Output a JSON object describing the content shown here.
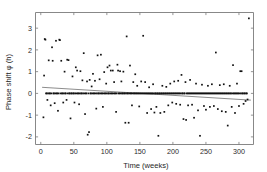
{
  "chart_data": {
    "type": "scatter",
    "title": "",
    "xlabel": "Time (weeks)",
    "ylabel": "Phase shift φ (h)",
    "xlim": [
      -8,
      322
    ],
    "ylim": [
      -2.35,
      3.72
    ],
    "xticks": [
      0,
      50,
      100,
      150,
      200,
      250,
      300
    ],
    "xticklabels": [
      "0",
      "50",
      "100",
      "150",
      "200",
      "250",
      "300"
    ],
    "yticks": [
      -2,
      -1,
      0,
      1,
      2,
      3
    ],
    "yticklabels": [
      "-2",
      "-1",
      "0",
      "1",
      "2",
      "3"
    ],
    "grid": false,
    "legend": null,
    "marker": "square",
    "marker_color": "#111111",
    "axis_color": "#7a7a7a",
    "trend_line": {
      "name": "linear fit",
      "color": "#6e6e6e",
      "x": [
        2,
        318
      ],
      "y": [
        0.28,
        -0.31
      ],
      "intercept": 0.284,
      "slope": -0.00187
    },
    "series": [
      {
        "name": "Phase shift observations",
        "points": [
          [
            4,
            -1.1
          ],
          [
            5,
            0.82
          ],
          [
            6,
            2.5
          ],
          [
            7,
            2.47
          ],
          [
            8,
            0.0
          ],
          [
            9,
            0.0
          ],
          [
            10,
            -0.3
          ],
          [
            11,
            0.0
          ],
          [
            12,
            1.52
          ],
          [
            13,
            0.0
          ],
          [
            14,
            0.0
          ],
          [
            15,
            -0.55
          ],
          [
            16,
            0.0
          ],
          [
            17,
            2.12
          ],
          [
            18,
            1.5
          ],
          [
            19,
            0.0
          ],
          [
            20,
            0.0
          ],
          [
            21,
            -0.45
          ],
          [
            22,
            0.0
          ],
          [
            23,
            2.42
          ],
          [
            24,
            0.0
          ],
          [
            25,
            0.0
          ],
          [
            26,
            -0.8
          ],
          [
            27,
            0.0
          ],
          [
            28,
            2.47
          ],
          [
            29,
            2.45
          ],
          [
            30,
            0.0
          ],
          [
            31,
            1.5
          ],
          [
            32,
            0.0
          ],
          [
            33,
            0.0
          ],
          [
            34,
            -0.42
          ],
          [
            35,
            0.0
          ],
          [
            36,
            1.0
          ],
          [
            37,
            0.0
          ],
          [
            38,
            0.0
          ],
          [
            39,
            -0.3
          ],
          [
            40,
            1.55
          ],
          [
            41,
            0.0
          ],
          [
            42,
            1.53
          ],
          [
            43,
            0.0
          ],
          [
            44,
            0.0
          ],
          [
            45,
            -1.15
          ],
          [
            46,
            0.0
          ],
          [
            47,
            0.0
          ],
          [
            48,
            0.78
          ],
          [
            49,
            0.0
          ],
          [
            50,
            0.0
          ],
          [
            51,
            -0.42
          ],
          [
            52,
            0.0
          ],
          [
            53,
            1.2
          ],
          [
            54,
            0.0
          ],
          [
            55,
            1.05
          ],
          [
            56,
            0.0
          ],
          [
            57,
            0.0
          ],
          [
            58,
            -0.5
          ],
          [
            59,
            0.0
          ],
          [
            60,
            1.02
          ],
          [
            61,
            0.0
          ],
          [
            62,
            0.0
          ],
          [
            63,
            0.6
          ],
          [
            64,
            0.0
          ],
          [
            65,
            1.85
          ],
          [
            66,
            0.0
          ],
          [
            67,
            -0.95
          ],
          [
            68,
            0.0
          ],
          [
            69,
            0.0
          ],
          [
            70,
            0.55
          ],
          [
            71,
            -1.9
          ],
          [
            72,
            0.0
          ],
          [
            73,
            -1.78
          ],
          [
            74,
            0.62
          ],
          [
            75,
            0.0
          ],
          [
            76,
            0.0
          ],
          [
            77,
            0.32
          ],
          [
            78,
            0.0
          ],
          [
            79,
            0.9
          ],
          [
            80,
            0.0
          ],
          [
            81,
            0.0
          ],
          [
            82,
            0.58
          ],
          [
            83,
            0.0
          ],
          [
            84,
            -0.7
          ],
          [
            85,
            0.0
          ],
          [
            86,
            1.75
          ],
          [
            87,
            0.0
          ],
          [
            88,
            0.0
          ],
          [
            89,
            0.65
          ],
          [
            90,
            0.0
          ],
          [
            91,
            1.78
          ],
          [
            92,
            0.0
          ],
          [
            93,
            0.0
          ],
          [
            94,
            -0.62
          ],
          [
            95,
            0.0
          ],
          [
            96,
            0.98
          ],
          [
            97,
            0.0
          ],
          [
            98,
            0.0
          ],
          [
            99,
            0.45
          ],
          [
            100,
            0.0
          ],
          [
            101,
            1.2
          ],
          [
            102,
            0.0
          ],
          [
            103,
            0.0
          ],
          [
            104,
            1.28
          ],
          [
            105,
            0.0
          ],
          [
            106,
            1.05
          ],
          [
            107,
            0.0
          ],
          [
            108,
            0.0
          ],
          [
            109,
            1.05
          ],
          [
            110,
            0.0
          ],
          [
            111,
            0.52
          ],
          [
            112,
            0.0
          ],
          [
            113,
            0.0
          ],
          [
            114,
            -0.85
          ],
          [
            115,
            0.0
          ],
          [
            116,
            1.32
          ],
          [
            117,
            1.05
          ],
          [
            118,
            0.0
          ],
          [
            119,
            0.0
          ],
          [
            120,
            1.02
          ],
          [
            121,
            0.0
          ],
          [
            122,
            0.55
          ],
          [
            123,
            0.0
          ],
          [
            124,
            0.0
          ],
          [
            125,
            1.0
          ],
          [
            126,
            0.0
          ],
          [
            127,
            0.0
          ],
          [
            128,
            -1.35
          ],
          [
            129,
            0.0
          ],
          [
            130,
            2.62
          ],
          [
            131,
            0.0
          ],
          [
            132,
            0.0
          ],
          [
            133,
            -1.35
          ],
          [
            134,
            0.0
          ],
          [
            135,
            1.28
          ],
          [
            136,
            0.0
          ],
          [
            137,
            0.0
          ],
          [
            138,
            -0.55
          ],
          [
            139,
            0.0
          ],
          [
            140,
            0.52
          ],
          [
            141,
            0.0
          ],
          [
            142,
            0.0
          ],
          [
            143,
            0.88
          ],
          [
            144,
            0.0
          ],
          [
            145,
            0.0
          ],
          [
            146,
            0.35
          ],
          [
            147,
            0.0
          ],
          [
            148,
            0.0
          ],
          [
            149,
            -0.6
          ],
          [
            150,
            0.0
          ],
          [
            151,
            0.0
          ],
          [
            152,
            0.55
          ],
          [
            153,
            0.0
          ],
          [
            154,
            0.0
          ],
          [
            155,
            2.65
          ],
          [
            156,
            0.0
          ],
          [
            157,
            0.0
          ],
          [
            158,
            0.52
          ],
          [
            159,
            0.0
          ],
          [
            160,
            0.0
          ],
          [
            161,
            -0.9
          ],
          [
            162,
            0.0
          ],
          [
            163,
            0.0
          ],
          [
            164,
            0.28
          ],
          [
            165,
            0.0
          ],
          [
            166,
            0.0
          ],
          [
            167,
            -0.72
          ],
          [
            168,
            0.0
          ],
          [
            169,
            0.0
          ],
          [
            170,
            0.42
          ],
          [
            171,
            0.0
          ],
          [
            172,
            -0.88
          ],
          [
            173,
            0.0
          ],
          [
            174,
            0.0
          ],
          [
            175,
            -0.62
          ],
          [
            176,
            0.0
          ],
          [
            177,
            0.0
          ],
          [
            178,
            -1.95
          ],
          [
            179,
            0.0
          ],
          [
            180,
            0.0
          ],
          [
            181,
            -0.9
          ],
          [
            182,
            0.0
          ],
          [
            183,
            0.0
          ],
          [
            184,
            0.35
          ],
          [
            185,
            0.0
          ],
          [
            186,
            0.0
          ],
          [
            187,
            -0.85
          ],
          [
            188,
            0.0
          ],
          [
            189,
            0.0
          ],
          [
            190,
            0.3
          ],
          [
            191,
            0.0
          ],
          [
            192,
            0.0
          ],
          [
            193,
            -0.55
          ],
          [
            194,
            0.0
          ],
          [
            195,
            0.0
          ],
          [
            196,
            0.45
          ],
          [
            197,
            0.0
          ],
          [
            198,
            0.0
          ],
          [
            199,
            -0.42
          ],
          [
            200,
            0.0
          ],
          [
            201,
            0.0
          ],
          [
            202,
            0.55
          ],
          [
            203,
            0.0
          ],
          [
            204,
            0.0
          ],
          [
            205,
            -0.48
          ],
          [
            206,
            0.0
          ],
          [
            207,
            0.0
          ],
          [
            208,
            0.58
          ],
          [
            209,
            0.0
          ],
          [
            210,
            0.0
          ],
          [
            211,
            -0.52
          ],
          [
            212,
            0.0
          ],
          [
            213,
            0.85
          ],
          [
            214,
            0.0
          ],
          [
            215,
            0.0
          ],
          [
            216,
            -1.18
          ],
          [
            217,
            0.0
          ],
          [
            218,
            0.0
          ],
          [
            219,
            0.52
          ],
          [
            220,
            -1.22
          ],
          [
            221,
            0.0
          ],
          [
            222,
            0.0
          ],
          [
            223,
            -0.55
          ],
          [
            224,
            0.0
          ],
          [
            225,
            0.0
          ],
          [
            226,
            0.62
          ],
          [
            227,
            0.0
          ],
          [
            228,
            0.0
          ],
          [
            229,
            -0.52
          ],
          [
            230,
            0.0
          ],
          [
            231,
            0.0
          ],
          [
            232,
            -1.12
          ],
          [
            233,
            0.0
          ],
          [
            234,
            0.0
          ],
          [
            235,
            0.45
          ],
          [
            236,
            0.0
          ],
          [
            237,
            0.0
          ],
          [
            238,
            -0.78
          ],
          [
            239,
            0.0
          ],
          [
            240,
            0.0
          ],
          [
            241,
            -1.95
          ],
          [
            242,
            0.0
          ],
          [
            243,
            0.0
          ],
          [
            244,
            0.4
          ],
          [
            245,
            0.0
          ],
          [
            246,
            0.0
          ],
          [
            247,
            -0.58
          ],
          [
            248,
            0.0
          ],
          [
            249,
            0.0
          ],
          [
            250,
            -0.75
          ],
          [
            251,
            0.0
          ],
          [
            252,
            0.0
          ],
          [
            253,
            0.35
          ],
          [
            254,
            0.0
          ],
          [
            255,
            0.0
          ],
          [
            256,
            -0.62
          ],
          [
            257,
            0.0
          ],
          [
            258,
            0.0
          ],
          [
            259,
            0.42
          ],
          [
            260,
            0.0
          ],
          [
            261,
            0.0
          ],
          [
            262,
            -0.58
          ],
          [
            263,
            0.0
          ],
          [
            264,
            0.0
          ],
          [
            265,
            1.88
          ],
          [
            266,
            0.0
          ],
          [
            267,
            0.0
          ],
          [
            268,
            -0.72
          ],
          [
            269,
            0.0
          ],
          [
            270,
            0.0
          ],
          [
            271,
            0.38
          ],
          [
            272,
            0.0
          ],
          [
            273,
            0.0
          ],
          [
            274,
            -0.82
          ],
          [
            275,
            0.0
          ],
          [
            276,
            0.0
          ],
          [
            277,
            0.42
          ],
          [
            278,
            0.0
          ],
          [
            279,
            0.0
          ],
          [
            280,
            -0.85
          ],
          [
            281,
            0.0
          ],
          [
            282,
            0.0
          ],
          [
            283,
            -1.48
          ],
          [
            284,
            0.0
          ],
          [
            285,
            0.0
          ],
          [
            286,
            0.35
          ],
          [
            287,
            0.0
          ],
          [
            288,
            0.0
          ],
          [
            289,
            -0.62
          ],
          [
            290,
            0.0
          ],
          [
            291,
            1.3
          ],
          [
            292,
            0.0
          ],
          [
            293,
            0.0
          ],
          [
            294,
            -0.9
          ],
          [
            295,
            0.0
          ],
          [
            296,
            0.0
          ],
          [
            297,
            0.45
          ],
          [
            298,
            0.0
          ],
          [
            299,
            0.0
          ],
          [
            300,
            -0.58
          ],
          [
            301,
            0.0
          ],
          [
            302,
            1.02
          ],
          [
            303,
            0.0
          ],
          [
            304,
            1.02
          ],
          [
            305,
            0.0
          ],
          [
            306,
            0.0
          ],
          [
            307,
            -0.48
          ],
          [
            308,
            0.0
          ],
          [
            309,
            0.0
          ],
          [
            310,
            -0.35
          ],
          [
            311,
            0.0
          ],
          [
            312,
            0.0
          ],
          [
            313,
            -0.28
          ],
          [
            315,
            3.45
          ]
        ]
      }
    ]
  }
}
